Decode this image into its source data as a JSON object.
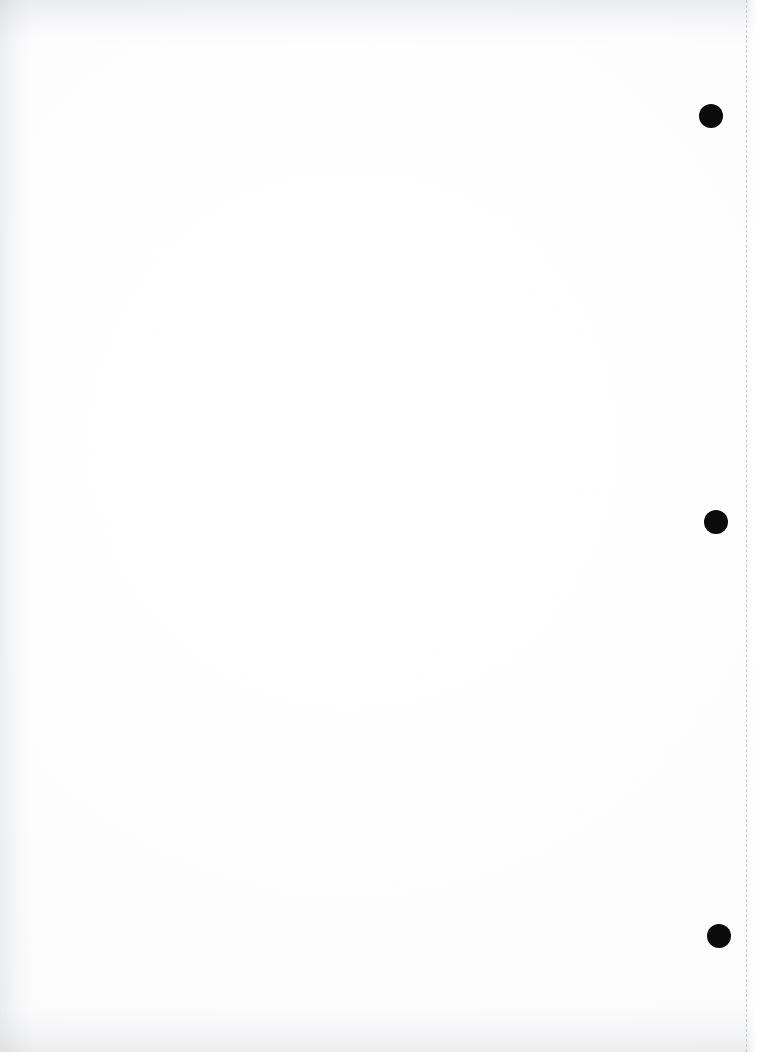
{
  "document": {
    "kind": "scanned-page",
    "state": "blank",
    "page_width": 763,
    "page_height": 1052,
    "paper_color": "#fefeff",
    "caption": ""
  },
  "fold_line": {
    "name": "perforation-guide",
    "orientation": "vertical",
    "x": 746,
    "top": 0,
    "bottom": 1052,
    "color": "#c9ccd1",
    "thickness": 1,
    "dash": "2px 6px"
  },
  "punch_holes": {
    "count": 3,
    "color": "#0b0b0b",
    "items": [
      {
        "label": "top punch hole",
        "cx": 711,
        "cy": 116,
        "r": 12
      },
      {
        "label": "middle punch hole",
        "cx": 716,
        "cy": 522,
        "r": 12
      },
      {
        "label": "bottom punch hole",
        "cx": 719,
        "cy": 936,
        "r": 12
      }
    ]
  },
  "edges": {
    "top_shadow": "#969aa0",
    "left_shadow": "#949298e",
    "bottom_shadow": "#969aa0",
    "right_highlight": "#ffffff"
  }
}
